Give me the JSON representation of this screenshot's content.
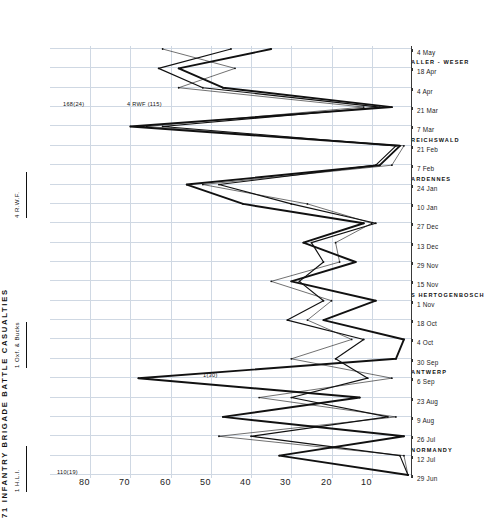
{
  "chart_data": {
    "type": "line",
    "title": "71 INFANTRY BRIGADE BATTLE CASUALTIES",
    "xlabel": "",
    "ylabel": "",
    "ylim": [
      0,
      90
    ],
    "yticks": [
      10,
      20,
      30,
      40,
      50,
      60,
      70,
      80
    ],
    "grid": true,
    "legend_position": "right",
    "categories": [
      "29 Jun",
      "12 Jul",
      "26 Jul",
      "9 Aug",
      "23 Aug",
      "6 Sep",
      "30 Sep",
      "4 Oct",
      "18 Oct",
      "1 Nov",
      "15 Nov",
      "29 Nov",
      "13 Dec",
      "27 Dec",
      "10 Jan",
      "24 Jan",
      "7 Feb",
      "21 Feb",
      "7 Mar",
      "21 Mar",
      "4 Apr",
      "18 Apr",
      "4 May"
    ],
    "series": [
      {
        "name": "4 R.W.F.",
        "style": "thick",
        "values": [
          1,
          33,
          2,
          47,
          13,
          68,
          4,
          2,
          22,
          9,
          30,
          14,
          27,
          12,
          42,
          56,
          8,
          3,
          70,
          5,
          47,
          58,
          35
        ]
      },
      {
        "name": "1 Oxf. & Bucks",
        "style": "thin",
        "values": [
          1,
          2,
          48,
          4,
          38,
          5,
          30,
          15,
          26,
          20,
          35,
          18,
          19,
          10,
          26,
          52,
          5,
          2,
          66,
          12,
          58,
          44,
          62
        ]
      },
      {
        "name": "1 H.L.I.",
        "style": "medium",
        "values": [
          1,
          3,
          40,
          6,
          30,
          11,
          19,
          12,
          31,
          22,
          28,
          22,
          25,
          9,
          30,
          48,
          9,
          4,
          62,
          8,
          52,
          63,
          45
        ]
      }
    ],
    "annotations": [
      {
        "label": "NORMANDY",
        "at": "12 Jul"
      },
      {
        "label": "ANTWERP",
        "at": "6 Sep"
      },
      {
        "label": "S HERTOGENBOSCH",
        "at": "1 Nov"
      },
      {
        "label": "ARDENNES",
        "at": "24 Jan"
      },
      {
        "label": "REICHSWALD",
        "at": "21 Feb"
      },
      {
        "label": "ALLER - WESER",
        "at": "18 Apr"
      }
    ],
    "peak_callouts": [
      {
        "label": "110(19)",
        "at": "29 Jun"
      },
      {
        "label": "1(30)",
        "at": "6 Sep"
      },
      {
        "label": "168(24)",
        "at": "21 Mar"
      },
      {
        "label": "4 RWF (115)",
        "at": "21 Mar"
      }
    ]
  },
  "legend": {
    "items": [
      {
        "label": "4 R.W.F."
      },
      {
        "label": "1 Oxf. & Bucks"
      },
      {
        "label": "1 H.L.I."
      }
    ]
  }
}
